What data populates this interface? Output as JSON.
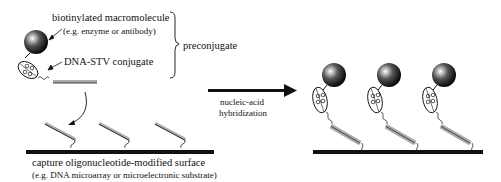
{
  "labels": {
    "macromolecule": "biotinylated macromolecule",
    "macromolecule_example": "(e.g. enzyme or antibody)",
    "conjugate": "DNA-STV conjugate",
    "preconjugate": "preconjugate",
    "process_line1": "nucleic-acid",
    "process_line2": "hybridization",
    "surface": "capture oligonucleotide-modified surface",
    "surface_example": "(e.g. DNA microarray or microelectronic substrate)"
  },
  "colors": {
    "ink": "#111111",
    "background": "#ffffff"
  },
  "left_panel": {
    "capture_strands": 3
  },
  "right_panel": {
    "hybridized_complexes": 3
  }
}
